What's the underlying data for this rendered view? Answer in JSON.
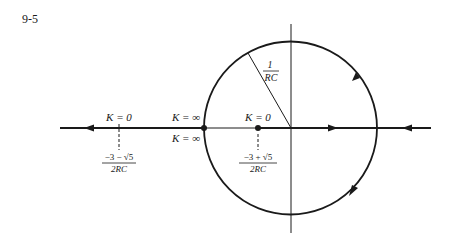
{
  "figure": {
    "number": "9-5",
    "type": "root-locus",
    "colors": {
      "ink": "#1a1a1a",
      "background": "#ffffff"
    }
  },
  "labels": {
    "radius": {
      "num": "1",
      "den": "RC"
    },
    "k_zero_left": "K = 0",
    "k_inf_top": "K = ∞",
    "k_inf_bottom": "K = ∞",
    "k_zero_right": "K = 0",
    "left_root": {
      "num": "−3 − √5",
      "den": "2RC"
    },
    "right_root": {
      "num": "−3 + √5",
      "den": "2RC"
    }
  }
}
